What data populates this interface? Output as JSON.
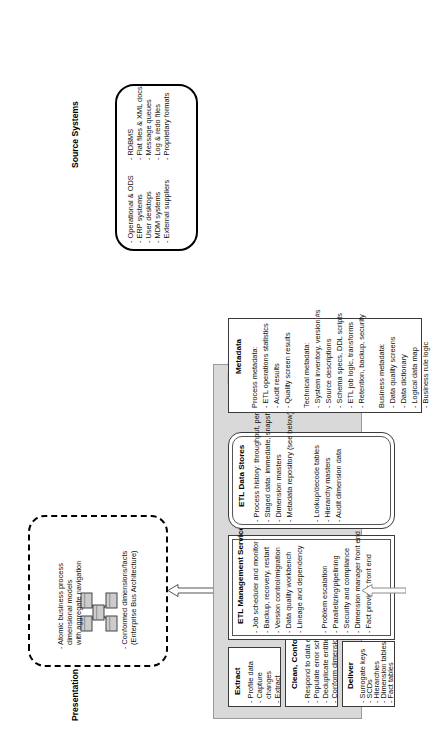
{
  "diagram": {
    "orientation": "rotated-90-ccw"
  },
  "presentation_server": {
    "title": "Presentation Server",
    "icon": "star-schema-icon",
    "bullets": [
      "- Atomic business process\n  dimensional models\n  with aggregate navigation",
      "- Conformed dimensions/facts\n  (Enterprise Bus Architecture)"
    ]
  },
  "etl_system": {
    "title": "ETL System",
    "extract": {
      "header": "Extract",
      "items": [
        "- Profile data",
        "- Capture",
        "  changes",
        "- Extract"
      ]
    },
    "clean_conform": {
      "header": "Clean, Conform",
      "items": [
        "- Respond to data errors",
        "- Populate error schema",
        "- Deduplicate entities",
        "- Conform dimensions"
      ]
    },
    "deliver": {
      "header": "Deliver",
      "items": [
        "- Surrogate keys",
        "- SCDs",
        "- Hierarchies",
        "- Dimension tables",
        "- Fact tables"
      ]
    },
    "management_services": {
      "header": "ETL Management Services",
      "items_left": [
        "- Job scheduler and monitor",
        "- Backup, recovery, restart",
        "- Version control/migration",
        "- Data quality workbench",
        "- Lineage and dependency"
      ],
      "items_right": [
        "- Problem escalation",
        "- Parallelizing/pipelining",
        "- Security and compliance",
        "- Dimension manager front end",
        "- Fact provider front end"
      ]
    },
    "data_stores": {
      "header": "ETL Data Stores",
      "items_left": [
        "- Process history: throughput, performance",
        "- Staged data: immediate, snapshot, archive",
        "- Dimension masters",
        "- Metadata repository (see below)"
      ],
      "items_right": [
        "- Lookup/decode tables",
        "- Hierarchy masters",
        "- Audit dimension data"
      ]
    }
  },
  "metadata": {
    "header": "Metadata",
    "process": {
      "label": "Process metadata:",
      "items": [
        "- ETL operations statistics",
        "- Audit results",
        "- Quality screen results"
      ]
    },
    "technical": {
      "label": "Technical metadata:",
      "items": [
        "- System inventory, version #s",
        "- Source descriptions",
        "- Schema specs, DDL scripts",
        "- ETL job logic, transforms",
        "- Retention, backup, security"
      ]
    },
    "business": {
      "label": "Business metadata:",
      "items": [
        "- Data quality screens",
        "- Data dictionary",
        "- Logical data map",
        "- Business rule logic"
      ]
    }
  },
  "source_systems": {
    "title": "Source Systems",
    "column_left": [
      "- Operational & ODS",
      "- ERP systems",
      "- User desktops",
      "- MDM systems",
      "- External suppliers"
    ],
    "column_right": [
      "- RDBMS",
      "- Flat files & XML docs",
      "- Message queues",
      "- Log & redo files",
      "- Proprietary formats"
    ]
  },
  "colors": {
    "panel_fill": "#d9d9d9",
    "box_fill": "#ffffff",
    "stroke": "#000000"
  }
}
